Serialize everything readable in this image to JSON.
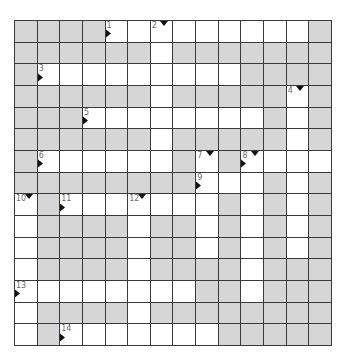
{
  "puzzle": {
    "cols": 14,
    "rows": 15,
    "colors": {
      "block": "#d6d6d6",
      "open": "#ffffff",
      "line": "#3a3a3a",
      "number": "#6b6b6b",
      "arrow": "#111111"
    },
    "layout": [
      "GGGGWWWWWWWWWG",
      "GGGGGGWGGGGGGG",
      "GWWWWWWWWWGGGG",
      "GGGGGGWGGGGGWG",
      "GGGWWWWWWWWGWG",
      "GGGGGGWGGGGGWG",
      "GWWWWWWGWGWWWW",
      "GGGGGGGGWWWGWG",
      "WGWWWWWWWGWGWG",
      "WGGGGWGGWGWGWG",
      "WGGGGWGGWGWGWG",
      "WGGGGWGGGGWGGG",
      "WWWWWWWWGGWGGG",
      "WGGGGWGGGGGGGG",
      "WGWWWWWWWGGGGG"
    ],
    "clues": [
      {
        "number": "1",
        "row": 0,
        "col": 4,
        "across": true,
        "down": false
      },
      {
        "number": "2",
        "row": 0,
        "col": 6,
        "across": false,
        "down": true
      },
      {
        "number": "3",
        "row": 2,
        "col": 1,
        "across": true,
        "down": false
      },
      {
        "number": "4",
        "row": 3,
        "col": 12,
        "across": false,
        "down": true
      },
      {
        "number": "5",
        "row": 4,
        "col": 3,
        "across": true,
        "down": false
      },
      {
        "number": "6",
        "row": 6,
        "col": 1,
        "across": true,
        "down": false
      },
      {
        "number": "7",
        "row": 6,
        "col": 8,
        "across": false,
        "down": true
      },
      {
        "number": "8",
        "row": 6,
        "col": 10,
        "across": true,
        "down": true
      },
      {
        "number": "9",
        "row": 7,
        "col": 8,
        "across": true,
        "down": false
      },
      {
        "number": "10",
        "row": 8,
        "col": 0,
        "across": false,
        "down": true
      },
      {
        "number": "11",
        "row": 8,
        "col": 2,
        "across": true,
        "down": false
      },
      {
        "number": "12",
        "row": 8,
        "col": 5,
        "across": false,
        "down": true
      },
      {
        "number": "13",
        "row": 12,
        "col": 0,
        "across": true,
        "down": false
      },
      {
        "number": "14",
        "row": 14,
        "col": 2,
        "across": true,
        "down": false
      }
    ]
  }
}
